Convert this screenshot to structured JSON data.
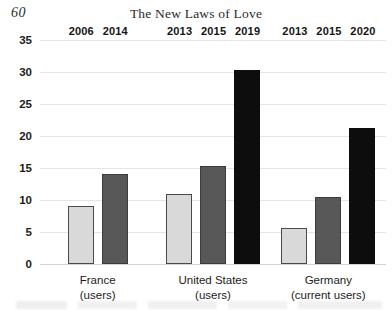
{
  "page": {
    "number": "60",
    "title": "The New Laws of Love"
  },
  "chart_data": {
    "type": "bar",
    "title": "The New Laws of Love",
    "xlabel": "",
    "ylabel": "",
    "ylim": [
      0,
      35
    ],
    "yticks": [
      0,
      5,
      10,
      15,
      20,
      25,
      30,
      35
    ],
    "ytick_labels": [
      "0",
      "5",
      "10",
      "15",
      "20",
      "25",
      "30",
      "35"
    ],
    "grid": true,
    "legend": "none",
    "categories": [
      {
        "line1": "France",
        "line2": "(users)"
      },
      {
        "line1": "United States",
        "line2": "(users)"
      },
      {
        "line1": "Germany",
        "line2": "(current users)"
      }
    ],
    "groups": [
      {
        "category": "France (users)",
        "bars": [
          {
            "label": "2006",
            "value": 9,
            "style": "light"
          },
          {
            "label": "2014",
            "value": 14,
            "style": "medium"
          }
        ]
      },
      {
        "category": "United States (users)",
        "bars": [
          {
            "label": "2013",
            "value": 11,
            "style": "light"
          },
          {
            "label": "2015",
            "value": 15.3,
            "style": "medium"
          },
          {
            "label": "2019",
            "value": 30.3,
            "style": "dark"
          }
        ]
      },
      {
        "category": "Germany (current users)",
        "bars": [
          {
            "label": "2013",
            "value": 5.7,
            "style": "light"
          },
          {
            "label": "2015",
            "value": 10.5,
            "style": "medium"
          },
          {
            "label": "2020",
            "value": 21.3,
            "style": "dark"
          }
        ]
      }
    ],
    "colors": {
      "light": "#d9d9d9",
      "medium": "#585858",
      "dark": "#0d0d0d",
      "gridline": "#e3e5e8",
      "text": "#1c1c1c"
    }
  }
}
